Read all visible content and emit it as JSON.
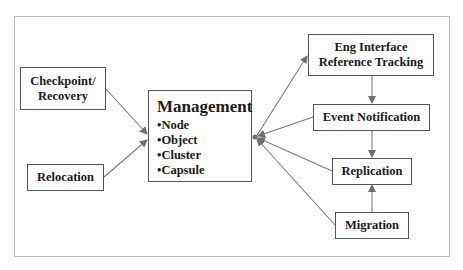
{
  "diagram": {
    "nodes": {
      "checkpoint": {
        "line1": "Checkpoint/",
        "line2": "Recovery"
      },
      "relocation": {
        "label": "Relocation"
      },
      "management": {
        "title": "Management",
        "items": [
          "•Node",
          "•Object",
          "•Cluster",
          "•Capsule"
        ]
      },
      "eng_interface": {
        "line1": "Eng Interface",
        "line2": "Reference Tracking"
      },
      "event_notification": {
        "label": "Event Notification"
      },
      "replication": {
        "label": "Replication"
      },
      "migration": {
        "label": "Migration"
      }
    },
    "edges": [
      {
        "from": "Checkpoint/Recovery",
        "to": "Management"
      },
      {
        "from": "Relocation",
        "to": "Management"
      },
      {
        "from": "Management",
        "to": "Eng Interface Reference Tracking"
      },
      {
        "from": "Event Notification",
        "to": "Management"
      },
      {
        "from": "Replication",
        "to": "Management"
      },
      {
        "from": "Migration",
        "to": "Management"
      },
      {
        "from": "Eng Interface Reference Tracking",
        "to": "Event Notification"
      },
      {
        "from": "Event Notification",
        "to": "Replication"
      },
      {
        "from": "Migration",
        "to": "Replication"
      }
    ],
    "colors": {
      "line": "#6e6e6e",
      "border": "#555555",
      "frame": "#bdbdbd"
    }
  }
}
